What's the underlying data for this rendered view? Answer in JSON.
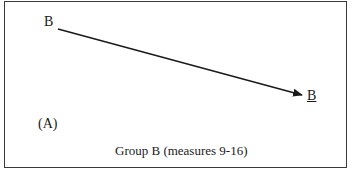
{
  "diagram": {
    "start_label": "B",
    "end_label": "B",
    "panel_tag": "(A)",
    "caption": "Group B (measures 9-16)",
    "arrow": {
      "from": [
        58,
        29
      ],
      "to": [
        303,
        95
      ],
      "color": "#1a1a1a"
    }
  }
}
